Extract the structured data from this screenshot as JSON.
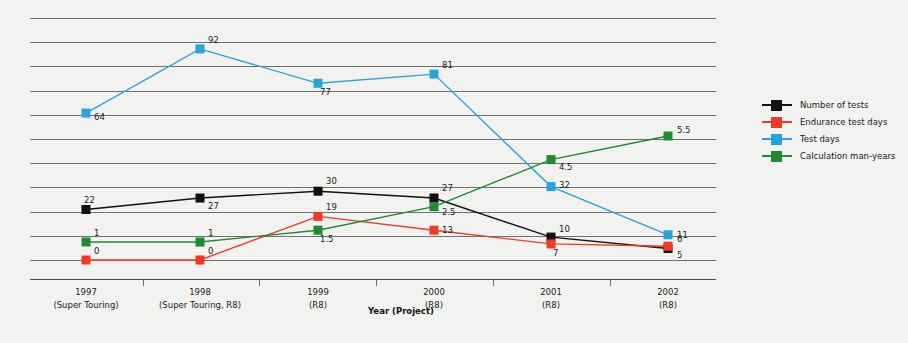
{
  "chart_data": {
    "type": "line",
    "title": "",
    "xlabel": "Year (Project)",
    "ylabel": "",
    "grid": true,
    "legend_position": "right",
    "categories": [
      "1997",
      "1998",
      "1999",
      "2000",
      "2001",
      "2002"
    ],
    "category_sublabels": [
      "(Super Touring)",
      "(Super Touring, R8)",
      "(R8)",
      "(R8)",
      "(R8)",
      "(R8)"
    ],
    "ylim": [
      0,
      100
    ],
    "gridlines": 11,
    "series": [
      {
        "name": "Number of tests",
        "color": "#111111",
        "values": [
          22,
          27,
          30,
          27,
          10,
          5
        ],
        "labels": [
          "22",
          "27",
          "30",
          "27",
          "10",
          "5"
        ]
      },
      {
        "name": "Endurance test days",
        "color": "#ef3b24",
        "values": [
          0,
          0,
          19,
          13,
          7,
          6
        ],
        "labels": [
          "0",
          "0",
          "19",
          "13",
          "7",
          "6"
        ]
      },
      {
        "name": "Test days",
        "color": "#29a3dc",
        "values": [
          64,
          92,
          77,
          81,
          32,
          11
        ],
        "labels": [
          "64",
          "92",
          "77",
          "81",
          "32",
          "11"
        ]
      },
      {
        "name": "Calculation man-years",
        "color": "#1e8a32",
        "values": [
          1,
          1,
          1.5,
          2.5,
          4.5,
          5.5
        ],
        "labels": [
          "1",
          "1",
          "1.5",
          "2.5",
          "4.5",
          "5.5"
        ]
      }
    ]
  },
  "legend": {
    "items": [
      {
        "label": "Number of tests",
        "color": "#111111"
      },
      {
        "label": "Endurance test days",
        "color": "#ef3b24"
      },
      {
        "label": "Test days",
        "color": "#29a3dc"
      },
      {
        "label": "Calculation man-years",
        "color": "#1e8a32"
      }
    ]
  },
  "axis": {
    "x_title": "Year (Project)"
  },
  "colors": {
    "background": "#f2f2f0",
    "gridline": "#5b5b5b",
    "text": "#1b1b1b"
  }
}
